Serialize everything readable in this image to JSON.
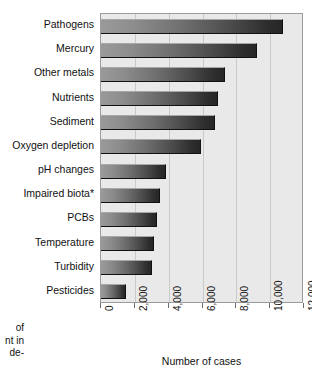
{
  "chart_data": {
    "type": "bar",
    "orientation": "horizontal",
    "title": "",
    "xlabel": "Number of cases",
    "ylabel": "",
    "categories": [
      "Pathogens",
      "Mercury",
      "Other metals",
      "Nutrients",
      "Sediment",
      "Oxygen depletion",
      "pH changes",
      "Impaired biota*",
      "PCBs",
      "Temperature",
      "Turbidity",
      "Pesticides"
    ],
    "values": [
      10750,
      9200,
      7350,
      6900,
      6750,
      5900,
      3850,
      3500,
      3300,
      3150,
      3000,
      1450
    ],
    "xlim": [
      0,
      12000
    ],
    "xticks": [
      0,
      2000,
      4000,
      6000,
      8000,
      10000,
      12000
    ],
    "xtick_labels": [
      "0",
      "2,000",
      "4,000",
      "6,000",
      "8,000",
      "10,000",
      "12,000"
    ],
    "xtick_label_rotation": 90,
    "grid": "vertical",
    "legend": "none",
    "bar_color_light": "#9a9a9a",
    "bar_color_dark": "#262626",
    "plot_background": "#e9e9e9",
    "gridline_color": "#c9c9c9",
    "axis_color": "#9b9b9b"
  },
  "caption_fragment": {
    "line1": "of",
    "line2": "nt in",
    "line3": "de-"
  }
}
